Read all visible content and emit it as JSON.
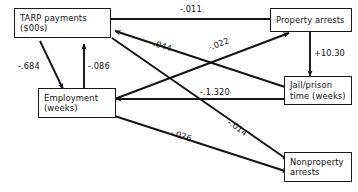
{
  "diagram": {
    "type": "path-diagram",
    "nodes": [
      {
        "id": "tarp",
        "line1": "TARP payments",
        "line2": "($00s)"
      },
      {
        "id": "employment",
        "line1": "Employment",
        "line2": "(weeks)"
      },
      {
        "id": "property",
        "line1": "Property arrests",
        "line2": ""
      },
      {
        "id": "jail",
        "line1": "Jail/prison",
        "line2": "time (weeks)"
      },
      {
        "id": "nonproperty",
        "line1": "Nonproperty",
        "line2": "arrests"
      }
    ],
    "edges": [
      {
        "id": "tarp-to-property",
        "from": "tarp",
        "to": "property",
        "label": "-.011"
      },
      {
        "id": "tarp-to-employment",
        "from": "tarp",
        "to": "employment",
        "label": "-.684"
      },
      {
        "id": "employment-to-tarp",
        "from": "employment",
        "to": "tarp",
        "label": "-.086"
      },
      {
        "id": "jail-to-tarp",
        "from": "jail",
        "to": "tarp",
        "label": "-.044"
      },
      {
        "id": "employment-to-property",
        "from": "employment",
        "to": "property",
        "label": "-.022"
      },
      {
        "id": "property-to-jail",
        "from": "property",
        "to": "jail",
        "label": "+10.30"
      },
      {
        "id": "jail-to-employment",
        "from": "jail",
        "to": "employment",
        "label": "-.1.320"
      },
      {
        "id": "employment-to-nonproperty",
        "from": "employment",
        "to": "nonproperty",
        "label": "-.026"
      },
      {
        "id": "tarp-to-nonproperty",
        "from": "tarp",
        "to": "nonproperty",
        "label": "-.014"
      }
    ],
    "colors": {
      "stroke": "#141414",
      "text": "#111111",
      "background": "#ffffff"
    }
  }
}
